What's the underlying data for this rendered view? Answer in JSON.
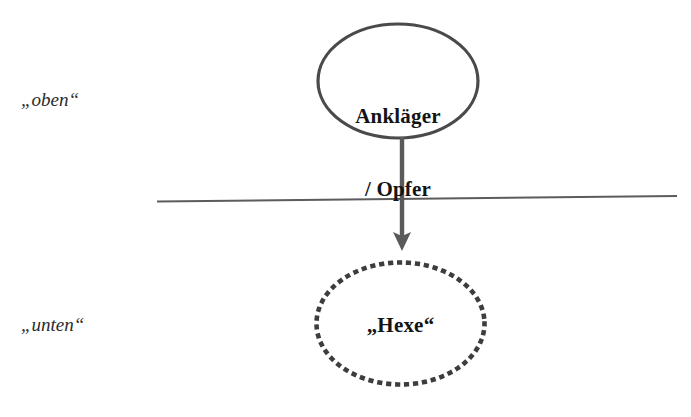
{
  "figure": {
    "heading_fragment": "Gemeinschaft",
    "labels": {
      "upper_side": "„oben“",
      "lower_side": "„unten“"
    },
    "nodes": [
      {
        "id": "accuser-victim",
        "line1": "Ankläger",
        "line2": "/ Opfer",
        "shape": "ellipse-solid",
        "stroke_color": "#4a4a4a"
      },
      {
        "id": "witch",
        "text": "„Hexe“",
        "shape": "ellipse-dotted",
        "stroke_color": "#3d3d3d"
      }
    ],
    "connector": {
      "id": "accusation-arrow",
      "direction": "down",
      "color": "#5a5a5a"
    },
    "divider": {
      "id": "social-boundary-line",
      "color": "#5c5c5c"
    },
    "colors": {
      "background": "#ffffff",
      "ink": "#1a1a1a",
      "stroke": "#4a4a4a"
    }
  }
}
